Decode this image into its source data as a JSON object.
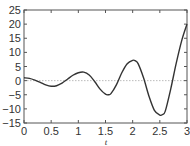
{
  "chart_data": {
    "type": "line",
    "title": "",
    "xlabel": "t",
    "ylabel": "",
    "xlim": [
      0,
      3
    ],
    "ylim": [
      -15,
      25
    ],
    "xticks": [
      0,
      0.5,
      1,
      1.5,
      2,
      2.5,
      3
    ],
    "xtick_labels": [
      "0",
      "0.5",
      "1",
      "1.5",
      "2",
      "2.5",
      "3"
    ],
    "yticks": [
      -15,
      -10,
      -5,
      0,
      5,
      10,
      15,
      20,
      25
    ],
    "ytick_labels": [
      "−15",
      "−10",
      "−5",
      "0",
      "5",
      "10",
      "15",
      "20",
      "25"
    ],
    "grid": false,
    "reference_line": {
      "y": 0,
      "style": "dotted",
      "color": "#aaaaaa"
    },
    "legend": null,
    "series": [
      {
        "name": "y(t)",
        "color": "#333333",
        "x": [
          0,
          0.1,
          0.2,
          0.3,
          0.4,
          0.5,
          0.6,
          0.7,
          0.8,
          0.9,
          1.0,
          1.1,
          1.2,
          1.3,
          1.4,
          1.5,
          1.55,
          1.6,
          1.7,
          1.8,
          1.9,
          2.0,
          2.05,
          2.1,
          2.2,
          2.3,
          2.4,
          2.5,
          2.55,
          2.6,
          2.7,
          2.8,
          2.9,
          3.0
        ],
        "y": [
          1.0,
          0.8,
          0.2,
          -0.6,
          -1.5,
          -2.0,
          -1.8,
          -0.9,
          0.5,
          1.9,
          2.8,
          3.0,
          2.0,
          -0.3,
          -3.0,
          -4.8,
          -5.0,
          -4.6,
          -1.5,
          2.8,
          6.0,
          7.2,
          7.0,
          6.0,
          1.0,
          -5.5,
          -10.5,
          -12.2,
          -12.0,
          -10.8,
          -3.0,
          6.0,
          14.0,
          20.0
        ]
      }
    ]
  }
}
